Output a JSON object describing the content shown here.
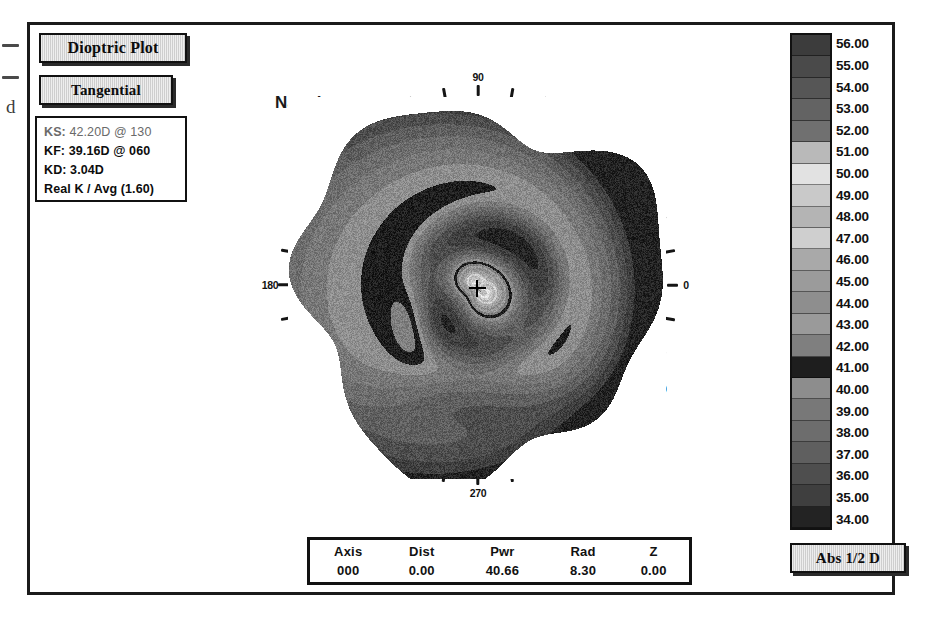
{
  "window": {
    "title": "Corneal Topography Dioptric Plot"
  },
  "controls": {
    "dioptric_plot_label": "Dioptric Plot",
    "map_mode_label": "Tangential",
    "scale_mode_label": "Abs 1/2 D"
  },
  "keratometry": {
    "ks_label": "KS:",
    "ks_value": "42.20D",
    "ks_at": "@",
    "ks_axis": "130",
    "kf_label": "KF:",
    "kf_value": "39.16D",
    "kf_at": "@",
    "kf_axis": "060",
    "kd_label": "KD:",
    "kd_value": "3.04D",
    "method_label": "Real K / Avg (1.60)"
  },
  "map": {
    "orientation_label": "Nasal",
    "degree_labels": [
      "0",
      "30",
      "60",
      "90",
      "120",
      "150",
      "180",
      "210",
      "240",
      "270",
      "300",
      "330"
    ],
    "center_marker": "crosshair"
  },
  "data_table": {
    "columns": [
      "Axis",
      "Dist",
      "Pwr",
      "Rad",
      "Z"
    ],
    "rows": [
      [
        "000",
        "0.00",
        "40.66",
        "8.30",
        "0.00"
      ]
    ]
  },
  "chart_data": {
    "type": "heatmap",
    "unit": "D",
    "scale_mode": "Abs 1/2 D",
    "colorbar_labels": [
      "56.00",
      "55.00",
      "54.00",
      "53.00",
      "52.00",
      "51.00",
      "50.00",
      "49.00",
      "48.00",
      "47.00",
      "46.00",
      "45.00",
      "44.00",
      "43.00",
      "42.00",
      "41.00",
      "40.00",
      "39.00",
      "38.00",
      "37.00",
      "36.00",
      "35.00",
      "34.00"
    ],
    "colorbar_min": 34.0,
    "colorbar_max": 56.0,
    "colorbar_step": 1.0,
    "colorbar_greys": [
      "#3c3c3c",
      "#4a4a4a",
      "#565656",
      "#636363",
      "#707070",
      "#b9b9b9",
      "#e2e2e2",
      "#c9c9c9",
      "#b4b4b4",
      "#cfcfcf",
      "#a9a9a9",
      "#9b9b9b",
      "#8e8e8e",
      "#9a9a9a",
      "#7f7f7f",
      "#1e1e1e",
      "#8d8d8d",
      "#787878",
      "#6d6d6d",
      "#5f5f5f",
      "#4e4e4e",
      "#3f3f3f",
      "#232323"
    ],
    "angle_ticks_deg": [
      0,
      10,
      20,
      30,
      40,
      50,
      60,
      70,
      80,
      90,
      100,
      110,
      120,
      130,
      140,
      150,
      160,
      170,
      180,
      190,
      200,
      210,
      220,
      230,
      240,
      250,
      260,
      270,
      280,
      290,
      300,
      310,
      320,
      330,
      340,
      350
    ],
    "steep_axis_deg": 130,
    "steep_power": 42.2,
    "flat_axis_deg": 60,
    "flat_power": 39.16,
    "astigmatism": 3.04,
    "cursor_readout": {
      "axis": 0,
      "dist": 0.0,
      "pwr": 40.66,
      "rad": 8.3,
      "z": 0.0
    }
  },
  "scan_artifacts": {
    "char": "d"
  }
}
